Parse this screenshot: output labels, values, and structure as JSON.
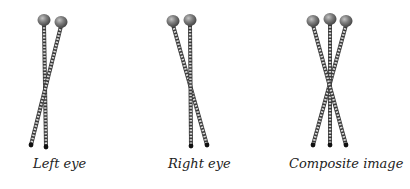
{
  "diagram": {
    "panels": [
      {
        "id": "left-eye",
        "label": "Left eye",
        "label_x": 33,
        "pins": [
          {
            "head": [
              44,
              20
            ],
            "tip": [
              46,
              147
            ]
          },
          {
            "head": [
              61,
              22
            ],
            "tip": [
              31,
              145
            ]
          }
        ]
      },
      {
        "id": "right-eye",
        "label": "Right eye",
        "label_x": 168,
        "pins": [
          {
            "head": [
              173,
              21
            ],
            "tip": [
              207,
              145
            ]
          },
          {
            "head": [
              190,
              20
            ],
            "tip": [
              191,
              146
            ]
          }
        ]
      },
      {
        "id": "composite-image",
        "label": "Composite image",
        "label_x": 289,
        "pins": [
          {
            "head": [
              346,
              21
            ],
            "tip": [
              313,
              145
            ]
          },
          {
            "head": [
              330,
              19
            ],
            "tip": [
              330,
              145
            ]
          },
          {
            "head": [
              313,
              21
            ],
            "tip": [
              346,
              145
            ]
          }
        ]
      }
    ],
    "colors": {
      "chain_dark": "#3a3a3a",
      "chain_light": "#d8d8d8",
      "head_fill": "#7a7a7a",
      "head_highlight": "#b8b8b8",
      "tip": "#111111",
      "label": "#222222"
    }
  }
}
